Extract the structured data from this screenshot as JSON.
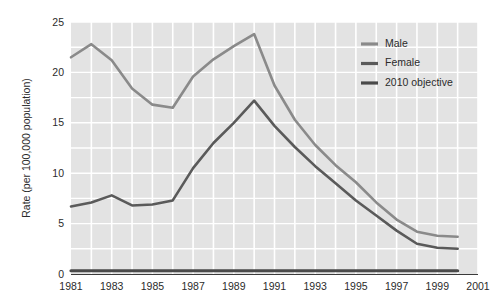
{
  "chart_data": {
    "type": "line",
    "title": "",
    "subtitle": "",
    "xlabel": "",
    "ylabel": "Rate (per 100,000 population)",
    "xlim": [
      1981,
      2001
    ],
    "ylim": [
      0,
      25
    ],
    "x_ticks": [
      "1981",
      "1983",
      "1985",
      "1987",
      "1989",
      "1991",
      "1993",
      "1995",
      "1997",
      "1999",
      "2001"
    ],
    "x_tick_values": [
      1981,
      1983,
      1985,
      1987,
      1989,
      1991,
      1993,
      1995,
      1997,
      1999,
      2001
    ],
    "y_ticks": [
      "0",
      "5",
      "10",
      "15",
      "20",
      "25"
    ],
    "y_tick_values": [
      0,
      5,
      10,
      15,
      20,
      25
    ],
    "grid": true,
    "grid_color": "#ffffff",
    "plot_background": "#e3e3e3",
    "grid_x_step": 1,
    "grid_y_step": 2.5,
    "legend_position": "top-right",
    "x": [
      1981,
      1982,
      1983,
      1984,
      1985,
      1986,
      1987,
      1988,
      1989,
      1990,
      1991,
      1992,
      1993,
      1994,
      1995,
      1996,
      1997,
      1998,
      1999,
      2000
    ],
    "series": [
      {
        "name": "Male",
        "color": "#8a8a8a",
        "width": 2.6,
        "values": [
          21.5,
          22.8,
          21.2,
          18.4,
          16.8,
          16.5,
          19.6,
          21.3,
          22.6,
          23.8,
          18.7,
          15.3,
          12.8,
          10.8,
          9.1,
          7.1,
          5.4,
          4.2,
          3.8,
          3.7
        ]
      },
      {
        "name": "Female",
        "color": "#5a5a5a",
        "width": 2.6,
        "values": [
          6.7,
          7.1,
          7.8,
          6.8,
          6.9,
          7.3,
          10.5,
          13.0,
          15.0,
          17.2,
          14.7,
          12.6,
          10.7,
          9.0,
          7.3,
          5.8,
          4.3,
          3.0,
          2.6,
          2.5
        ]
      },
      {
        "name": "2010 objective",
        "color": "#4a4a4a",
        "width": 3.2,
        "constant": 0.32,
        "values": [
          0.32,
          0.32,
          0.32,
          0.32,
          0.32,
          0.32,
          0.32,
          0.32,
          0.32,
          0.32,
          0.32,
          0.32,
          0.32,
          0.32,
          0.32,
          0.32,
          0.32,
          0.32,
          0.32,
          0.32
        ]
      }
    ],
    "legend": [
      {
        "label": "Male",
        "color": "#8a8a8a"
      },
      {
        "label": "Female",
        "color": "#5a5a5a"
      },
      {
        "label": "2010 objective",
        "color": "#4a4a4a"
      }
    ]
  }
}
